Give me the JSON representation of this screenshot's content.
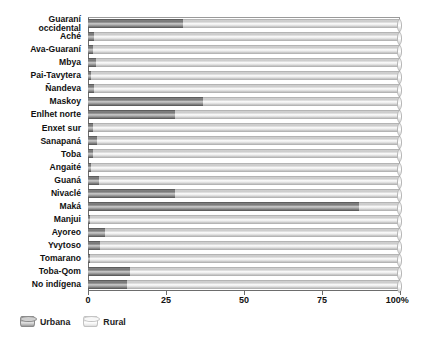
{
  "chart_data": {
    "type": "bar",
    "orientation": "horizontal",
    "stacked": true,
    "title": "",
    "xlabel": "",
    "ylabel": "",
    "xlim": [
      0,
      100
    ],
    "xticks": [
      0,
      25,
      50,
      75,
      100
    ],
    "xticklabels": [
      "0",
      "25",
      "50",
      "75",
      "100%"
    ],
    "grid": false,
    "legend_position": "bottom-left",
    "categories": [
      "Guaraní\noccidental",
      "Aché",
      "Ava-Guaraní",
      "Mbya",
      "Pai-Tavytera",
      "Ñandeva",
      "Maskoy",
      "Enlhet norte",
      "Enxet sur",
      "Sanapaná",
      "Toba",
      "Angaité",
      "Guaná",
      "Nivaclé",
      "Maká",
      "Manjui",
      "Ayoreo",
      "Yvytoso",
      "Tomarano",
      "Toba-Qom",
      "No indígena"
    ],
    "series": [
      {
        "name": "Urbana",
        "color": "#757575",
        "values": [
          30.5,
          2.0,
          1.5,
          2.5,
          1.0,
          2.0,
          37.0,
          28.0,
          1.5,
          3.0,
          1.5,
          1.0,
          3.5,
          28.0,
          87.0,
          0.8,
          5.5,
          4.0,
          0.5,
          13.5,
          12.5
        ]
      },
      {
        "name": "Rural",
        "color": "#e8e8e8",
        "values": [
          69.5,
          98.0,
          98.5,
          97.5,
          99.0,
          98.0,
          63.0,
          72.0,
          98.5,
          97.0,
          98.5,
          99.0,
          96.5,
          72.0,
          13.0,
          99.2,
          94.5,
          96.0,
          99.5,
          86.5,
          87.5
        ]
      }
    ]
  },
  "legend": {
    "items": [
      {
        "label": "Urbana",
        "icon": "cylinder-icon",
        "key": "urbana"
      },
      {
        "label": "Rural",
        "icon": "cylinder-icon",
        "key": "rural"
      }
    ]
  }
}
